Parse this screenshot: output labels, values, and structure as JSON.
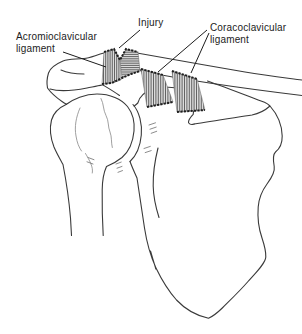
{
  "figure": {
    "background": "#ffffff",
    "ink_color": "#3a3a3a",
    "detail_color": "#8f8f8f",
    "hatch_color": "#6f6f6f",
    "ligament_fill": "#dcdcdc",
    "ligament_stripe": "#5c5c5c",
    "ligament_edge": "#1f1f1f",
    "label_color": "#1c1c1c"
  },
  "labels": {
    "injury": "Injury",
    "acromioclavicular_line1": "Acromioclavicular",
    "acromioclavicular_line2": "ligament",
    "coracoclavicular_line1": "Coracoclavicular",
    "coracoclavicular_line2": "ligament"
  }
}
